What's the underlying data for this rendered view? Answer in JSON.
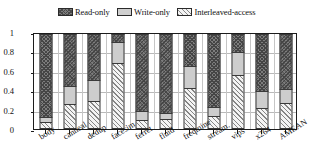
{
  "chart_data": {
    "type": "bar",
    "stacked": true,
    "title": "",
    "xlabel": "",
    "ylabel": "",
    "ylim": [
      0,
      1
    ],
    "yticks": [
      "0",
      "0.2",
      "0.4",
      "0.6",
      "0.8",
      "1"
    ],
    "ytick_values": [
      0,
      0.2,
      0.4,
      0.6,
      0.8,
      1
    ],
    "grid": true,
    "legend_position": "top-center",
    "categories": [
      "body",
      "canneal",
      "dedup",
      "facesim",
      "ferret",
      "fluid",
      "freqmine",
      "stream.",
      "vips",
      "x264",
      "AMEAN"
    ],
    "series": [
      {
        "name": "Interleaved-access",
        "fill": "light-diagonal-hatch",
        "color": "#f4f4f4",
        "values": [
          0.07,
          0.265,
          0.29,
          0.69,
          0.09,
          0.105,
          0.43,
          0.14,
          0.565,
          0.225,
          0.275
        ]
      },
      {
        "name": "Write-only",
        "fill": "solid-light-gray",
        "color": "#cdcdcd",
        "values": [
          0.06,
          0.185,
          0.225,
          0.225,
          0.095,
          0.06,
          0.235,
          0.095,
          0.25,
          0.175,
          0.145
        ]
      },
      {
        "name": "Read-only",
        "fill": "dense-cross-hatch",
        "color": "#7d7d7d",
        "values": [
          0.87,
          0.55,
          0.485,
          0.085,
          0.815,
          0.835,
          0.335,
          0.765,
          0.185,
          0.6,
          0.58
        ]
      }
    ],
    "stack_order_bottom_to_top": [
      "Interleaved-access",
      "Write-only",
      "Read-only"
    ]
  },
  "legend": {
    "entries": [
      {
        "label": "Read-only",
        "swatch": "read-only-swatch"
      },
      {
        "label": "Write-only",
        "swatch": "write-only-swatch"
      },
      {
        "label": "Interleaved-access",
        "swatch": "interleaved-access-swatch"
      }
    ]
  }
}
